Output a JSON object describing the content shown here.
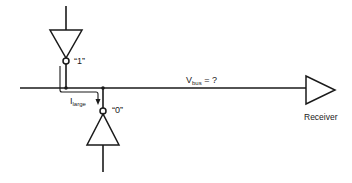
{
  "diagram": {
    "top_driver": {
      "output_label": "“1”"
    },
    "bottom_driver": {
      "output_label": "“0”"
    },
    "current": {
      "symbol": "I",
      "subscript": "large"
    },
    "bus": {
      "symbol": "V",
      "subscript": "bus",
      "suffix": " = ?"
    },
    "receiver": {
      "label": "Receiver"
    },
    "colors": {
      "ink": "#1a1a1a",
      "background": "#ffffff"
    }
  }
}
